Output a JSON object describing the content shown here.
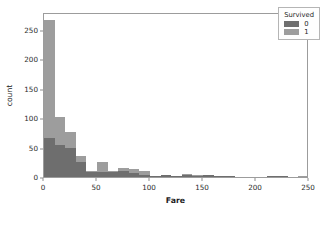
{
  "chart_data": {
    "type": "bar",
    "title": "",
    "xlabel": "Fare",
    "ylabel": "count",
    "xlim": [
      0,
      250
    ],
    "ylim": [
      0,
      280
    ],
    "grid": false,
    "legend_position": "upper right",
    "legend_title": "Survived",
    "bin_width": 10,
    "stacking": "overlay",
    "x_ticks": [
      "0",
      "50",
      "100",
      "150",
      "200",
      "250"
    ],
    "x_tick_values": [
      0,
      50,
      100,
      150,
      200,
      250
    ],
    "y_ticks": [
      "0",
      "50",
      "100",
      "150",
      "200",
      "250"
    ],
    "y_tick_values": [
      0,
      50,
      100,
      150,
      200,
      250
    ],
    "bin_starts": [
      0,
      10,
      20,
      30,
      40,
      50,
      60,
      70,
      80,
      90,
      100,
      110,
      120,
      130,
      140,
      150,
      160,
      170,
      180,
      190,
      200,
      210,
      220,
      230,
      240
    ],
    "series": [
      {
        "name": "0",
        "label": "0",
        "color": "#6e6e6e",
        "values": [
          66,
          54,
          50,
          25,
          9,
          8,
          8,
          10,
          7,
          4,
          1,
          3,
          1,
          4,
          2,
          3,
          1,
          1,
          0,
          0,
          0,
          1,
          1,
          0,
          0
        ]
      },
      {
        "name": "1",
        "label": "1",
        "color": "#9d9d9d",
        "values": [
          267,
          102,
          77,
          35,
          11,
          26,
          11,
          16,
          13,
          11,
          2,
          4,
          1,
          5,
          4,
          3,
          2,
          1,
          0,
          0,
          0,
          2,
          2,
          0,
          1
        ]
      }
    ]
  },
  "legend": {
    "title": "Survived",
    "entries": [
      {
        "label": "0",
        "color": "#6e6e6e"
      },
      {
        "label": "1",
        "color": "#9d9d9d"
      }
    ]
  },
  "axes": {
    "x_label": "Fare",
    "y_label": "count"
  }
}
